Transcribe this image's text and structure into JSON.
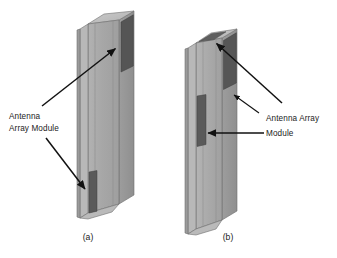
{
  "figure": {
    "title_caption_a": "(a)",
    "title_caption_b": "(b)",
    "background_color": "#ffffff",
    "labels": {
      "left_label_line1": "Antenna",
      "left_label_line2": "Array Module",
      "right_label_line1": "Antenna Array",
      "right_label_line2": "Module"
    },
    "colors": {
      "panel_front": "#a9a9a9",
      "panel_front_light": "#b6b6b6",
      "panel_side": "#9a9a9a",
      "panel_top": "#c4c4c4",
      "panel_bevel": "#bdbdbd",
      "antenna_patch": "#5c5c5c",
      "antenna_patch_dark": "#4e4e4e",
      "outline": "#6f6f6f",
      "arrow": "#111111",
      "text": "#1b1b1b"
    },
    "diagram_a": {
      "name": "handset-single-antenna-module",
      "antenna_patches": [
        {
          "id": "patch-top-right-edge",
          "location": "upper right side rail"
        },
        {
          "id": "patch-bottom-left-edge",
          "location": "lower left front panel"
        }
      ],
      "arrow_count": 2
    },
    "diagram_b": {
      "name": "handset-multi-antenna-module",
      "antenna_patches": [
        {
          "id": "patch-top-bevel",
          "location": "top bevel face"
        },
        {
          "id": "patch-right-rail-upper",
          "location": "upper right side rail"
        },
        {
          "id": "patch-left-front-mid",
          "location": "middle left front panel"
        }
      ],
      "arrow_count": 3
    }
  }
}
